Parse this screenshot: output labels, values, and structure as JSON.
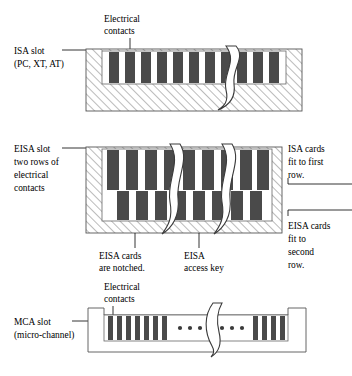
{
  "figure": {
    "background_color": "#ffffff",
    "line_color": "#555555",
    "contact_color": "#4a4a4a",
    "hatch_color": "#777777"
  },
  "sections": [
    {
      "id": "isa",
      "left_label_lines": [
        "ISA slot",
        "(PC, XT, AT)"
      ],
      "top_label_lines": [
        "Electrical",
        "contacts"
      ],
      "contact_rows": 1,
      "contact_count": 12,
      "breaks": 1,
      "housing_hatched": true
    },
    {
      "id": "eisa",
      "left_label_lines": [
        "EISA slot",
        "two rows of",
        "electrical",
        "contacts"
      ],
      "right_label_top_lines": [
        "ISA cards",
        "fit to first",
        "row."
      ],
      "right_label_bottom_lines": [
        "EISA cards",
        "fit to",
        "second",
        "row."
      ],
      "bottom_label_left_lines": [
        "EISA cards",
        "are notched."
      ],
      "bottom_label_right_lines": [
        "EISA",
        "access key"
      ],
      "contact_rows": 2,
      "upper_contact_count": 9,
      "lower_contact_count": 8,
      "breaks": 2,
      "housing_hatched": true
    },
    {
      "id": "mca",
      "left_label_lines": [
        "MCA slot",
        "(micro-channel)"
      ],
      "top_label_lines": [
        "Electrical",
        "contacts"
      ],
      "contact_rows": 1,
      "contact_count_left": 7,
      "contact_count_right": 7,
      "ellipsis_dots": 3,
      "breaks": 1,
      "housing_hatched": false
    }
  ]
}
